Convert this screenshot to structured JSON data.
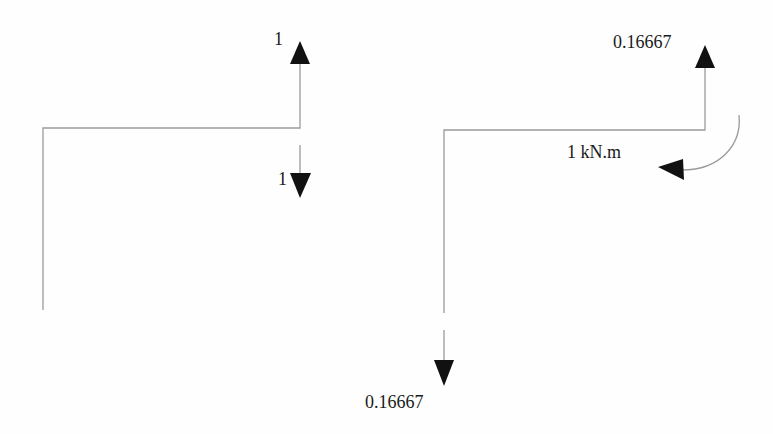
{
  "diagram": {
    "type": "free-body-diagram",
    "colors": {
      "member_line": "#9a9a9a",
      "arrow": "#111111",
      "text": "#1a1a1a",
      "background": "#fefefe"
    },
    "left_structure": {
      "description": "L-shaped frame with unit vertical loads at the tip",
      "labels": {
        "top_force": "1",
        "bottom_force": "1"
      },
      "forces": [
        {
          "label": "1",
          "direction": "up",
          "location": "top end of right vertical"
        },
        {
          "label": "1",
          "direction": "down",
          "location": "below joint"
        }
      ]
    },
    "right_structure": {
      "description": "L-shaped frame with reactions and applied moment",
      "labels": {
        "top_force": "0.16667",
        "moment": "1 kN.m",
        "bottom_force": "0.16667"
      },
      "forces": [
        {
          "label": "0.16667",
          "direction": "up",
          "location": "top of right vertical"
        },
        {
          "label": "0.16667",
          "direction": "down",
          "location": "base of left vertical"
        }
      ],
      "moments": [
        {
          "label": "1 kN.m",
          "direction": "counterclockwise-arc",
          "location": "near top-right joint"
        }
      ]
    }
  }
}
